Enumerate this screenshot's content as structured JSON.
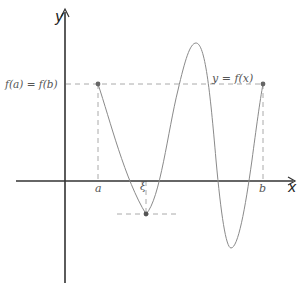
{
  "diagram": {
    "labels": {
      "y_axis": "y",
      "x_axis": "x",
      "a": "a",
      "b": "b",
      "xi": "ξ",
      "fa_eq_fb": "f(a) = f(b)",
      "curve": "y = f(x)"
    },
    "colors": {
      "axis": "#333333",
      "curve": "#8a8a8a",
      "dashed": "#9a9a9a",
      "point": "#666666",
      "text": "#555555"
    },
    "points": {
      "a": {
        "x": 98,
        "y": 84
      },
      "b": {
        "x": 263,
        "y": 84
      },
      "xi": {
        "x": 146,
        "y": 214
      },
      "peak": {
        "x": 196,
        "y": 43
      },
      "trough": {
        "x": 231,
        "y": 248
      }
    }
  }
}
